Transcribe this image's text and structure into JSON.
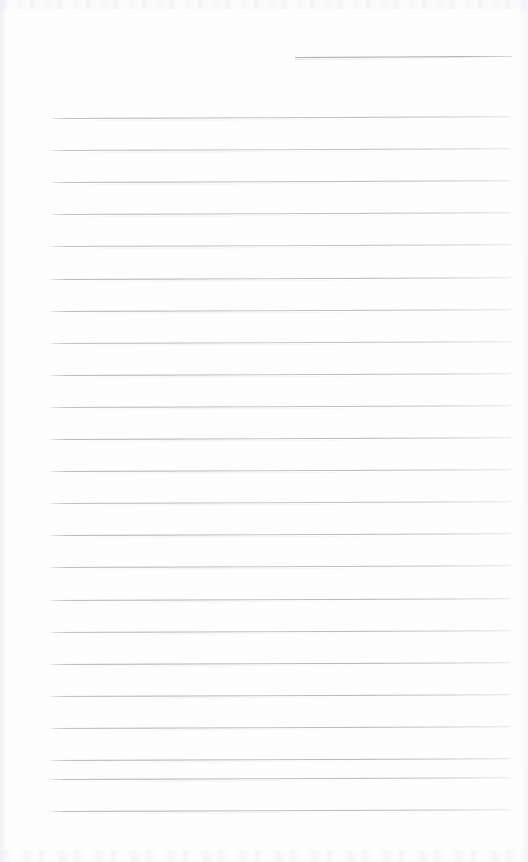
{
  "document": {
    "kind": "scanned-blank-ruled-page",
    "title": "",
    "body_text": "",
    "page_width": 528,
    "page_height": 862,
    "background_color": "#fefefe",
    "rule_color": "#a6aab0",
    "header_rule_color": "#8c9096"
  },
  "header_rule": {
    "x": 295,
    "y": 57,
    "width": 217,
    "tilt_deg": -0.25
  },
  "ruled_lines": {
    "left_x": 50,
    "right_x": 511,
    "width": 461,
    "first_y": 118,
    "spacing": 32.1,
    "count": 23,
    "tilt_deg": -0.22,
    "y_positions": [
      118.0,
      150.1,
      182.2,
      214.3,
      246.4,
      278.5,
      310.6,
      342.7,
      374.8,
      406.9,
      439.0,
      471.1,
      503.2,
      535.3,
      567.4,
      599.5,
      631.6,
      663.7,
      695.8,
      727.9,
      760.0,
      778.5,
      810.6
    ],
    "opacities": [
      0.92,
      0.88,
      0.95,
      0.9,
      0.86,
      0.93,
      0.89,
      0.84,
      0.91,
      0.87,
      0.94,
      0.9,
      0.85,
      0.92,
      0.88,
      0.9,
      0.86,
      0.93,
      0.89,
      0.87,
      0.91,
      0.95,
      0.93
    ]
  },
  "annotations": {
    "handwriting": [],
    "stamps": [],
    "marginalia": []
  }
}
